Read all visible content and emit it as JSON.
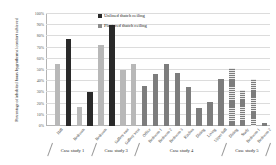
{
  "chart_data": {
    "type": "bar",
    "title": "",
    "xlabel": "",
    "ylabel": "Percentage of inhabited hours hygrothermal comfort achieved",
    "ylim": [
      0,
      100
    ],
    "grid": true,
    "legend_position": "top-center",
    "ytick_labels": [
      "0%",
      "10%",
      "20%",
      "30%",
      "40%",
      "50%",
      "60%",
      "70%",
      "80%",
      "90%",
      "100%"
    ],
    "ytick_values": [
      0,
      10,
      20,
      30,
      40,
      50,
      60,
      70,
      80,
      90,
      100
    ],
    "legend": [
      {
        "name": "Unlined thatch ceiling",
        "color": "#2a2a2a"
      },
      {
        "name": "Plastered thatch ceiling",
        "color": "#8c8c8c"
      }
    ],
    "groups": [
      {
        "label": "Case study 1",
        "start": 0,
        "end": 1
      },
      {
        "label": "Case study 3",
        "start": 2,
        "end": 4
      },
      {
        "label": "Case study 4",
        "start": 5,
        "end": 12
      },
      {
        "label": "Case study 5",
        "start": 13,
        "end": 16
      }
    ],
    "categories": [
      "Hall",
      "Bedroom",
      "Bedroom",
      "Gallery east",
      "Gallery west",
      "Office",
      "Bedroom 1",
      "Bedroom 2",
      "Bedroom 3",
      "Kitchen",
      "Dining",
      "Living",
      "Upper hall",
      "Dining",
      "Study",
      "Bedroom 1",
      "Bedroom 2"
    ],
    "bars": [
      {
        "category": "Hall",
        "group": "Case study 1",
        "series": "Plastered thatch ceiling",
        "value": 55,
        "style": "plastered"
      },
      {
        "category": "Hall",
        "group": "Case study 1",
        "series": "Unlined thatch ceiling",
        "value": 78,
        "style": "unlined"
      },
      {
        "category": "Bedroom",
        "group": "Case study 1",
        "series": "Plastered thatch ceiling",
        "value": 17,
        "style": "plastered"
      },
      {
        "category": "Bedroom",
        "group": "Case study 1",
        "series": "Unlined thatch ceiling",
        "value": 30,
        "style": "unlined"
      },
      {
        "category": "Bedroom",
        "group": "Case study 3",
        "series": "Plastered thatch ceiling",
        "value": 72,
        "style": "plastered"
      },
      {
        "category": "Bedroom",
        "group": "Case study 3",
        "series": "Unlined thatch ceiling",
        "value": 90,
        "style": "unlined"
      },
      {
        "category": "Gallery east",
        "group": "Case study 3",
        "series": "Plastered thatch ceiling",
        "value": 50,
        "style": "plastered"
      },
      {
        "category": "Gallery west",
        "group": "Case study 3",
        "series": "Plastered thatch ceiling",
        "value": 55,
        "style": "plastered"
      },
      {
        "category": "Office",
        "group": "Case study 4",
        "series": "Plastered thatch ceiling",
        "value": 36,
        "style": "mid"
      },
      {
        "category": "Bedroom 1",
        "group": "Case study 4",
        "series": "Plastered thatch ceiling",
        "value": 46,
        "style": "mid"
      },
      {
        "category": "Bedroom 2",
        "group": "Case study 4",
        "series": "Plastered thatch ceiling",
        "value": 55,
        "style": "mid"
      },
      {
        "category": "Bedroom 3",
        "group": "Case study 4",
        "series": "Plastered thatch ceiling",
        "value": 47,
        "style": "mid"
      },
      {
        "category": "Kitchen",
        "group": "Case study 4",
        "series": "Plastered thatch ceiling",
        "value": 35,
        "style": "mid"
      },
      {
        "category": "Dining",
        "group": "Case study 4",
        "series": "Plastered thatch ceiling",
        "value": 16,
        "style": "mid"
      },
      {
        "category": "Living",
        "group": "Case study 4",
        "series": "Plastered thatch ceiling",
        "value": 21,
        "style": "mid"
      },
      {
        "category": "Upper hall",
        "group": "Case study 4",
        "series": "Plastered thatch ceiling",
        "value": 42,
        "style": "mid"
      },
      {
        "category": "Dining",
        "group": "Case study 5",
        "series": "Plastered thatch ceiling",
        "value": 52,
        "style": "hatch"
      },
      {
        "category": "Study",
        "group": "Case study 5",
        "series": "Plastered thatch ceiling",
        "value": 32,
        "style": "hatch"
      },
      {
        "category": "Bedroom 1",
        "group": "Case study 5",
        "series": "Plastered thatch ceiling",
        "value": 42,
        "style": "hatch"
      },
      {
        "category": "Bedroom 2",
        "group": "Case study 5",
        "series": "Plastered thatch ceiling",
        "value": 3,
        "style": "mid"
      }
    ]
  }
}
